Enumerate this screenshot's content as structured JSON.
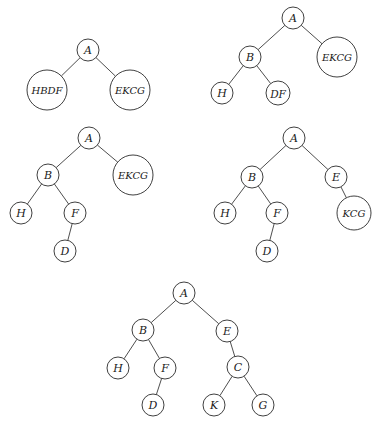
{
  "figure": {
    "width": 375,
    "height": 429
  },
  "trees": [
    {
      "id": "tree-step-1",
      "nodes": [
        {
          "id": "A",
          "label": "A",
          "x": 88,
          "y": 50,
          "r": 11,
          "font": 11
        },
        {
          "id": "HBDF",
          "label": "HBDF",
          "x": 47,
          "y": 90,
          "r": 20,
          "font": 10
        },
        {
          "id": "EKCG",
          "label": "EKCG",
          "x": 130,
          "y": 90,
          "r": 20,
          "font": 10
        }
      ],
      "edges": [
        [
          "A",
          "HBDF"
        ],
        [
          "A",
          "EKCG"
        ]
      ]
    },
    {
      "id": "tree-step-2",
      "nodes": [
        {
          "id": "A",
          "label": "A",
          "x": 293,
          "y": 18,
          "r": 11,
          "font": 11
        },
        {
          "id": "B",
          "label": "B",
          "x": 250,
          "y": 57,
          "r": 11,
          "font": 11
        },
        {
          "id": "EKCG",
          "label": "EKCG",
          "x": 337,
          "y": 57,
          "r": 20,
          "font": 10
        },
        {
          "id": "H",
          "label": "H",
          "x": 222,
          "y": 93,
          "r": 11,
          "font": 11
        },
        {
          "id": "DF",
          "label": "DF",
          "x": 278,
          "y": 93,
          "r": 12,
          "font": 10.5
        }
      ],
      "edges": [
        [
          "A",
          "B"
        ],
        [
          "A",
          "EKCG"
        ],
        [
          "B",
          "H"
        ],
        [
          "B",
          "DF"
        ]
      ]
    },
    {
      "id": "tree-step-3",
      "nodes": [
        {
          "id": "A",
          "label": "A",
          "x": 89,
          "y": 138,
          "r": 11,
          "font": 11
        },
        {
          "id": "B",
          "label": "B",
          "x": 48,
          "y": 175,
          "r": 11,
          "font": 11
        },
        {
          "id": "EKCG",
          "label": "EKCG",
          "x": 133,
          "y": 175,
          "r": 20,
          "font": 10
        },
        {
          "id": "H",
          "label": "H",
          "x": 21,
          "y": 213,
          "r": 11,
          "font": 11
        },
        {
          "id": "F",
          "label": "F",
          "x": 75,
          "y": 213,
          "r": 11,
          "font": 11
        },
        {
          "id": "D",
          "label": "D",
          "x": 65,
          "y": 251,
          "r": 11,
          "font": 11
        }
      ],
      "edges": [
        [
          "A",
          "B"
        ],
        [
          "A",
          "EKCG"
        ],
        [
          "B",
          "H"
        ],
        [
          "B",
          "F"
        ],
        [
          "F",
          "D"
        ]
      ]
    },
    {
      "id": "tree-step-4",
      "nodes": [
        {
          "id": "A",
          "label": "A",
          "x": 294,
          "y": 138,
          "r": 11,
          "font": 11
        },
        {
          "id": "B",
          "label": "B",
          "x": 252,
          "y": 177,
          "r": 11,
          "font": 11
        },
        {
          "id": "E",
          "label": "E",
          "x": 336,
          "y": 177,
          "r": 11,
          "font": 11
        },
        {
          "id": "H",
          "label": "H",
          "x": 225,
          "y": 213,
          "r": 11,
          "font": 11
        },
        {
          "id": "F",
          "label": "F",
          "x": 277,
          "y": 213,
          "r": 11,
          "font": 11
        },
        {
          "id": "KCG",
          "label": "KCG",
          "x": 354,
          "y": 213,
          "r": 17,
          "font": 10
        },
        {
          "id": "D",
          "label": "D",
          "x": 267,
          "y": 251,
          "r": 11,
          "font": 11
        }
      ],
      "edges": [
        [
          "A",
          "B"
        ],
        [
          "A",
          "E"
        ],
        [
          "B",
          "H"
        ],
        [
          "B",
          "F"
        ],
        [
          "E",
          "KCG"
        ],
        [
          "F",
          "D"
        ]
      ]
    },
    {
      "id": "tree-step-5",
      "nodes": [
        {
          "id": "A",
          "label": "A",
          "x": 184,
          "y": 293,
          "r": 11,
          "font": 11
        },
        {
          "id": "B",
          "label": "B",
          "x": 143,
          "y": 330,
          "r": 11,
          "font": 11
        },
        {
          "id": "E",
          "label": "E",
          "x": 227,
          "y": 331,
          "r": 11,
          "font": 11
        },
        {
          "id": "H",
          "label": "H",
          "x": 118,
          "y": 368,
          "r": 11,
          "font": 11
        },
        {
          "id": "F",
          "label": "F",
          "x": 165,
          "y": 368,
          "r": 11,
          "font": 11
        },
        {
          "id": "C",
          "label": "C",
          "x": 238,
          "y": 367,
          "r": 11,
          "font": 11
        },
        {
          "id": "D",
          "label": "D",
          "x": 153,
          "y": 405,
          "r": 11,
          "font": 11
        },
        {
          "id": "K",
          "label": "K",
          "x": 214,
          "y": 405,
          "r": 11,
          "font": 11
        },
        {
          "id": "G",
          "label": "G",
          "x": 263,
          "y": 405,
          "r": 11,
          "font": 11
        }
      ],
      "edges": [
        [
          "A",
          "B"
        ],
        [
          "A",
          "E"
        ],
        [
          "B",
          "H"
        ],
        [
          "B",
          "F"
        ],
        [
          "F",
          "D"
        ],
        [
          "E",
          "C"
        ],
        [
          "C",
          "K"
        ],
        [
          "C",
          "G"
        ]
      ]
    }
  ]
}
